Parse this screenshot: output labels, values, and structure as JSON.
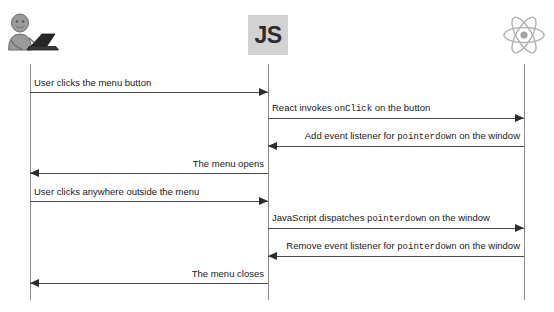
{
  "diagram": {
    "type": "sequence-diagram",
    "title": "",
    "width": 554,
    "height": 312,
    "line_color": "#4a4a4a",
    "lifeline_color": "#8e8e8e",
    "badge_color": "#d2d2d2",
    "actors": [
      {
        "id": "user",
        "label": "",
        "icon": "person-with-laptop-icon",
        "x": 30
      },
      {
        "id": "js",
        "label": "JS",
        "icon": "js-logo-icon",
        "x": 268
      },
      {
        "id": "react",
        "label": "",
        "icon": "react-atom-logo-icon",
        "x": 524
      }
    ],
    "messages": [
      {
        "id": "m1",
        "text_parts": [
          {
            "t": "User clicks the menu button",
            "code": false
          }
        ],
        "from": "user",
        "to": "js",
        "direction": "right",
        "align": "left",
        "y": 92
      },
      {
        "id": "m2",
        "text_parts": [
          {
            "t": "React invokes ",
            "code": false
          },
          {
            "t": "onClick",
            "code": true
          },
          {
            "t": " on the button",
            "code": false
          }
        ],
        "from": "js",
        "to": "react",
        "direction": "right",
        "align": "left",
        "y": 118
      },
      {
        "id": "m3",
        "text_parts": [
          {
            "t": "Add event listener for ",
            "code": false
          },
          {
            "t": "pointerdown",
            "code": true
          },
          {
            "t": " on the window",
            "code": false
          }
        ],
        "from": "react",
        "to": "js",
        "direction": "left",
        "align": "right",
        "y": 146
      },
      {
        "id": "m4",
        "text_parts": [
          {
            "t": "The menu opens",
            "code": false
          }
        ],
        "from": "js",
        "to": "user",
        "direction": "left",
        "align": "right",
        "y": 173
      },
      {
        "id": "m5",
        "text_parts": [
          {
            "t": "User clicks anywhere outside the menu",
            "code": false
          }
        ],
        "from": "user",
        "to": "js",
        "direction": "right",
        "align": "left",
        "y": 201
      },
      {
        "id": "m6",
        "text_parts": [
          {
            "t": "JavaScript dispatches ",
            "code": false
          },
          {
            "t": "pointerdown",
            "code": true
          },
          {
            "t": " on the window",
            "code": false
          }
        ],
        "from": "js",
        "to": "react",
        "direction": "right",
        "align": "left",
        "y": 228
      },
      {
        "id": "m7",
        "text_parts": [
          {
            "t": "Remove event listener for ",
            "code": false
          },
          {
            "t": "pointerdown",
            "code": true
          },
          {
            "t": " on the window",
            "code": false
          }
        ],
        "from": "react",
        "to": "js",
        "direction": "left",
        "align": "right",
        "y": 256
      },
      {
        "id": "m8",
        "text_parts": [
          {
            "t": "The menu closes",
            "code": false
          }
        ],
        "from": "js",
        "to": "user",
        "direction": "left",
        "align": "right",
        "y": 283
      }
    ]
  }
}
